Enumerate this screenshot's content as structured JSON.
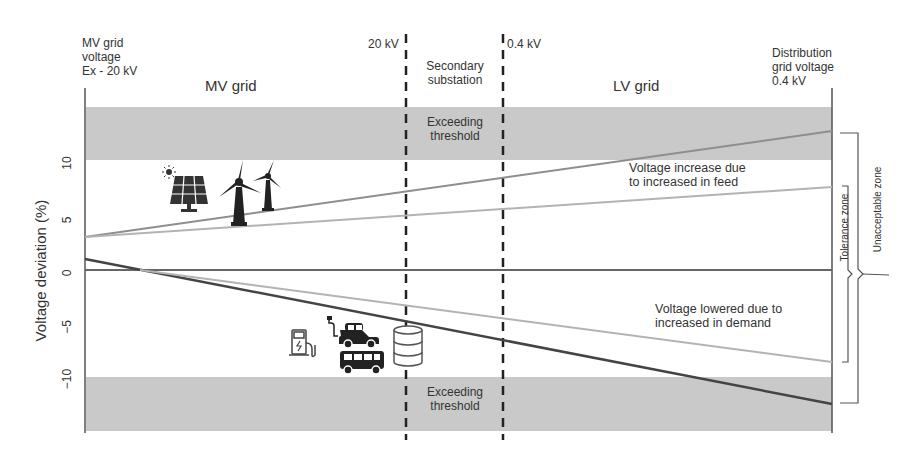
{
  "header": {
    "left_label": [
      "MV grid",
      "voltage",
      "Ex - 20 kV"
    ],
    "right_label": [
      "Distribution",
      "grid voltage",
      "0.4 kV"
    ],
    "mv_grid": "MV grid",
    "lv_grid": "LV grid",
    "kv20": "20 kV",
    "kv04": "0.4 kV",
    "substation": [
      "Secondary",
      "substation"
    ]
  },
  "axis": {
    "ylabel": "Voltage deviation (%)",
    "ticks": [
      "10",
      "5",
      "0",
      "−5",
      "−10"
    ]
  },
  "bands": {
    "top_label": [
      "Exceeding",
      "threshold"
    ],
    "bottom_label": [
      "Exceeding",
      "threshold"
    ],
    "color": "#c9c9c9"
  },
  "annotations": {
    "increase": [
      "Voltage increase due",
      "to increased in feed"
    ],
    "decrease": [
      "Voltage lowered due to",
      "increased in demand"
    ],
    "tolerance_zone": "Tolerance zone",
    "unacceptable_zone": "Unacceptable zone"
  },
  "icons": {
    "generation": [
      "sun-icon",
      "solar-panel-icon",
      "wind-turbine-icon",
      "wind-turbine-small-icon"
    ],
    "demand": [
      "ev-charger-icon",
      "electric-car-icon",
      "bus-icon",
      "storage-battery-icon"
    ]
  },
  "colors": {
    "dark_line": "#444444",
    "light_line": "#9a9a9a",
    "band": "#c9c9c9",
    "axis": "#555555"
  }
}
